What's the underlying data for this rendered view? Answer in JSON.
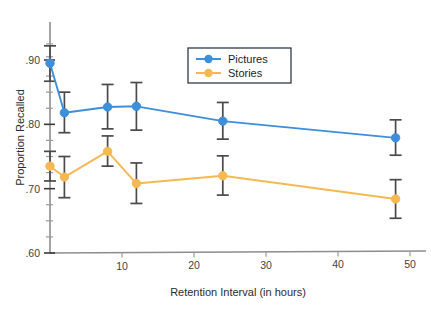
{
  "chart_data": {
    "type": "line",
    "title": "",
    "xlabel": "Retention Interval (in hours)",
    "ylabel": "Proportion Recalled",
    "xlim": [
      0,
      50
    ],
    "ylim": [
      0.6,
      0.93
    ],
    "grid": false,
    "legend_position": "top-center-right",
    "x_ticks": [
      "10",
      "20",
      "30",
      "40",
      "50"
    ],
    "x_tick_values": [
      10,
      20,
      30,
      40,
      50
    ],
    "y_ticks": [
      ".60",
      ".70",
      ".80",
      ".90"
    ],
    "y_tick_values": [
      0.6,
      0.7,
      0.8,
      0.9
    ],
    "y_minor_values": [
      0.625,
      0.65,
      0.675,
      0.725,
      0.75,
      0.775,
      0.825,
      0.85,
      0.875,
      0.905,
      0.925
    ],
    "x": [
      0,
      2,
      8,
      12,
      24,
      48
    ],
    "series": [
      {
        "name": "Pictures",
        "color": "#3d8fdb",
        "values": [
          0.895,
          0.818,
          0.827,
          0.828,
          0.805,
          0.779
        ],
        "err_low": [
          0.867,
          0.787,
          0.793,
          0.791,
          0.777,
          0.752
        ],
        "err_high": [
          0.922,
          0.85,
          0.862,
          0.865,
          0.834,
          0.807
        ]
      },
      {
        "name": "Stories",
        "color": "#f5b952",
        "values": [
          0.735,
          0.718,
          0.758,
          0.708,
          0.72,
          0.684
        ],
        "err_low": [
          0.712,
          0.686,
          0.735,
          0.677,
          0.69,
          0.654
        ],
        "err_high": [
          0.758,
          0.75,
          0.782,
          0.74,
          0.751,
          0.714
        ]
      }
    ]
  },
  "legend": {
    "entries": [
      {
        "label": "Pictures",
        "color": "#3d8fdb"
      },
      {
        "label": "Stories",
        "color": "#f5b952"
      }
    ]
  }
}
